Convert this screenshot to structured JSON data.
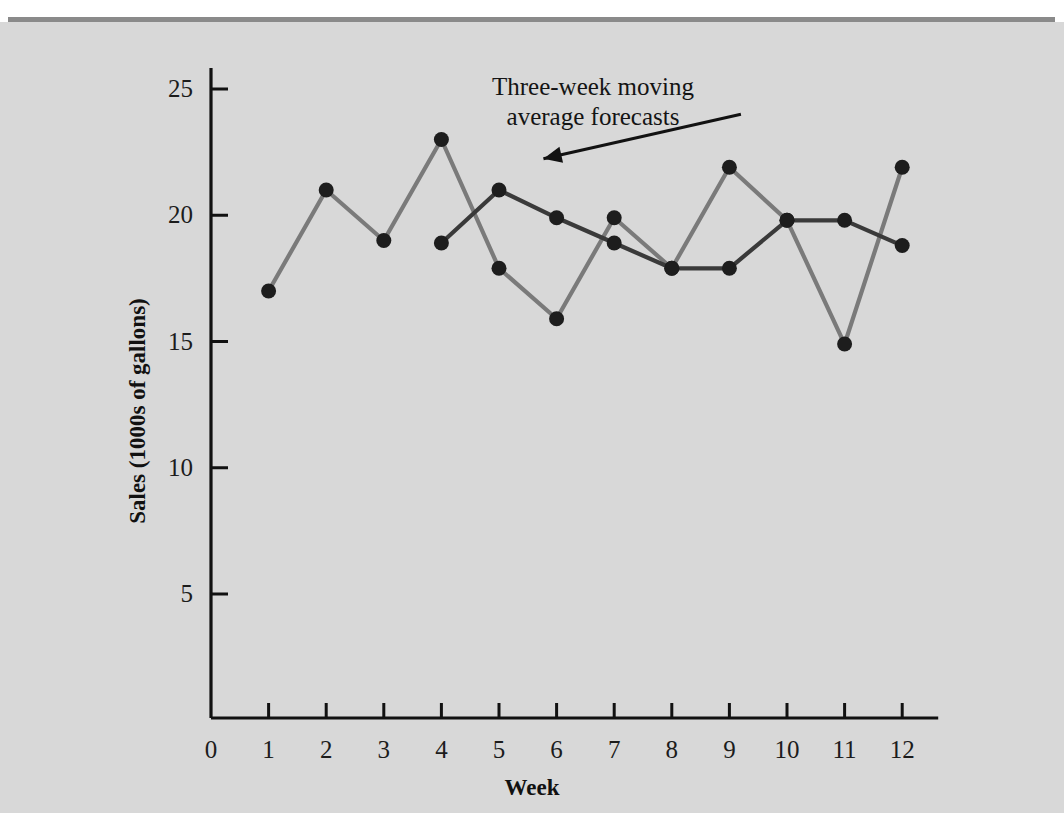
{
  "figure": {
    "background_color": "#d8d8d8",
    "rule_color": "#8a8a8a",
    "annotation_line1": "Three-week moving",
    "annotation_line2": "average forecasts"
  },
  "chart_data": {
    "type": "line",
    "title": "",
    "xlabel": "Week",
    "ylabel": "Sales (1000s of gallons)",
    "x": [
      1,
      2,
      3,
      4,
      5,
      6,
      7,
      8,
      9,
      10,
      11,
      12
    ],
    "xlim": [
      0,
      12.4
    ],
    "ylim": [
      0,
      26.5
    ],
    "xticks": [
      0,
      1,
      2,
      3,
      4,
      5,
      6,
      7,
      8,
      9,
      10,
      11,
      12
    ],
    "xtick_labels": [
      "0",
      "1",
      "2",
      "3",
      "4",
      "5",
      "6",
      "7",
      "8",
      "9",
      "10",
      "11",
      "12"
    ],
    "yticks": [
      5,
      10,
      15,
      20,
      25
    ],
    "ytick_labels": [
      "5",
      "10",
      "15",
      "20",
      "25"
    ],
    "grid": false,
    "legend": "none",
    "annotations": [
      {
        "text": "Three-week moving average forecasts",
        "points_to_series": "Three-week moving average forecasts",
        "arrow_from_x": 9.2,
        "arrow_from_y": 24.0,
        "arrow_to_x": 5.65,
        "arrow_to_y": 21.8
      }
    ],
    "series": [
      {
        "name": "Actual sales",
        "color": "#7a7a7a",
        "marker": "circle",
        "x": [
          1,
          2,
          3,
          4,
          5,
          6,
          7,
          8,
          9,
          10,
          11,
          12
        ],
        "values": [
          17.0,
          21.0,
          19.0,
          23.0,
          17.9,
          15.9,
          19.9,
          17.9,
          21.9,
          19.8,
          14.9,
          21.9
        ]
      },
      {
        "name": "Three-week moving average forecasts",
        "color": "#3a3a3a",
        "marker": "circle",
        "x": [
          4,
          5,
          6,
          7,
          8,
          9,
          10,
          11,
          12
        ],
        "values": [
          18.9,
          21.0,
          19.9,
          18.9,
          17.9,
          17.9,
          19.8,
          19.8,
          18.8
        ]
      }
    ]
  }
}
